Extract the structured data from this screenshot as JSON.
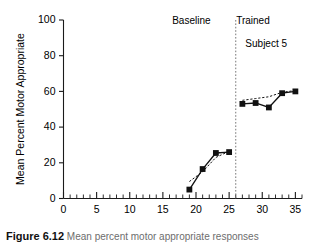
{
  "figure": {
    "caption_label": "Figure 6.12",
    "caption_text": "  Mean percent motor appropriate responses",
    "subject_note": "Subject 5"
  },
  "annotations": {
    "baseline_label": "Baseline",
    "trained_label": "Trained",
    "subject_label": "Subject 5"
  },
  "colors": {
    "axis": "#1a1a1a",
    "series": "#111111",
    "divider": "#777777",
    "background": "#ffffff"
  },
  "chart_data": {
    "type": "line",
    "title": "",
    "subtitle": "Subject 5",
    "xlabel": "",
    "ylabel": "Mean Percent Motor Appropriate",
    "xlim": [
      0,
      36
    ],
    "ylim": [
      0,
      100
    ],
    "grid": false,
    "legend_position": "none",
    "x_ticks_major": [
      0,
      5,
      10,
      15,
      20,
      25,
      30,
      35
    ],
    "x_tick_labels": [
      "0",
      "5",
      "10",
      "15",
      "20",
      "25",
      "30",
      "35"
    ],
    "x_minor_tick_step": 1,
    "y_ticks": [
      0,
      20,
      40,
      60,
      80,
      100
    ],
    "y_tick_labels": [
      "0",
      "20",
      "40",
      "60",
      "80",
      "100"
    ],
    "phase_divider_x": 26,
    "series": [
      {
        "name": "Baseline",
        "style": "solid",
        "marker": "filled-square",
        "x": [
          19,
          21,
          23,
          25
        ],
        "values": [
          5,
          16.5,
          25.5,
          26
        ]
      },
      {
        "name": "Baseline trend",
        "style": "dotted",
        "marker": "none",
        "x": [
          19,
          21,
          23,
          25
        ],
        "values": [
          9.5,
          15,
          23,
          26.5
        ]
      },
      {
        "name": "Trained",
        "style": "solid",
        "marker": "filled-square",
        "x": [
          27,
          29,
          31,
          33,
          35
        ],
        "values": [
          53,
          53.5,
          51,
          59,
          60
        ]
      },
      {
        "name": "Trained trend",
        "style": "dotted",
        "marker": "none",
        "x": [
          27,
          29,
          31,
          33,
          35
        ],
        "values": [
          55,
          56,
          57,
          59.5,
          60.5
        ]
      }
    ],
    "annotations": [
      {
        "text": "Baseline",
        "x": 19.3,
        "y": 98
      },
      {
        "text": "Trained",
        "x": 28.6,
        "y": 98
      },
      {
        "text": "Subject 5",
        "x": 30.6,
        "y": 85
      }
    ]
  }
}
